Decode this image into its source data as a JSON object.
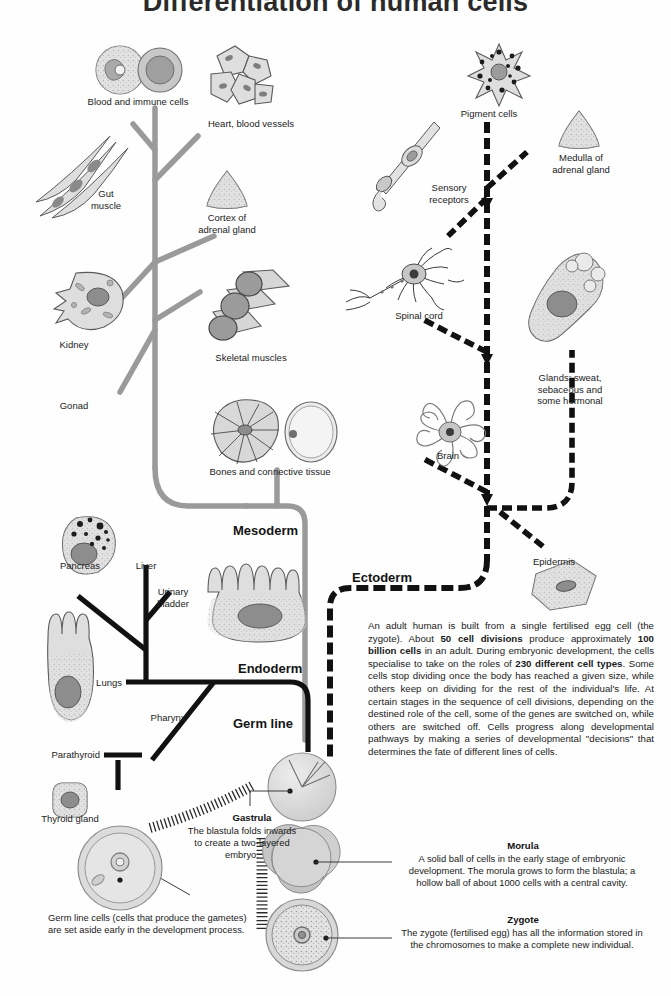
{
  "title": "Differentiation of human cells",
  "colors": {
    "mesoderm_line": "#9a9a9a",
    "endoderm_line": "#111111",
    "ectoderm_line": "#111111",
    "germline_line": "#333333",
    "cell_fill": "#dcdcdc",
    "cell_stroke": "#555555",
    "nucleus": "#8a8a8a",
    "text": "#1b1b1b"
  },
  "germ_layers": {
    "mesoderm": "Mesoderm",
    "endoderm": "Endoderm",
    "ectoderm": "Ectoderm",
    "germ_line": "Germ line"
  },
  "mesoderm_labels": [
    {
      "text": "Blood and immune cells"
    },
    {
      "text": "Heart, blood vessels"
    },
    {
      "text": "Gut\nmuscle"
    },
    {
      "text": "Cortex of\nadrenal gland"
    },
    {
      "text": "Kidney"
    },
    {
      "text": "Skeletal muscles"
    },
    {
      "text": "Gonad"
    },
    {
      "text": "Bones and connective tissue"
    }
  ],
  "endoderm_labels": [
    {
      "text": "Pancreas"
    },
    {
      "text": "Liver"
    },
    {
      "text": "Urinary\nbladder"
    },
    {
      "text": "Lungs"
    },
    {
      "text": "Pharynx"
    },
    {
      "text": "Parathyroid"
    },
    {
      "text": "Thyroid gland"
    }
  ],
  "ectoderm_labels": [
    {
      "text": "Pigment cells"
    },
    {
      "text": "Medulla of\nadrenal gland"
    },
    {
      "text": "Sensory\nreceptors"
    },
    {
      "text": "Spinal cord"
    },
    {
      "text": "Glands: sweat,\nsebaceous and\nsome hormonal"
    },
    {
      "text": "Brain"
    },
    {
      "text": "Epidermis"
    }
  ],
  "main_text": {
    "p1_a": "An adult human is built from a single fertilised egg cell (the zygote). About ",
    "p1_b1": "50 cell divisions",
    "p1_c": " produce approximately ",
    "p1_b2": "100 billion cells",
    "p1_d": " in an adult. During embryonic development, the cells specialise to take on the roles of ",
    "p1_b3": "230 different cell types",
    "p1_e": ". Some cells stop dividing once the body has reached a given size, while others keep on dividing for the rest of the individual's life.  At certain stages in the sequence of cell divisions, depending on the destined role of the cell, some of the genes are switched on, while others are switched off. Cells progress along developmental pathways by making a series of developmental \"decisions\" that determines the fate of different lines of cells."
  },
  "stages": {
    "gastrula": {
      "title": "Gastrula",
      "body": "The blastula folds\ninwards to create a\ntwo-layered embryo."
    },
    "morula": {
      "title": "Morula",
      "body": "A solid ball of cells in the early stage of embryonic development. The morula grows to form the blastula; a hollow ball of about 1000 cells with a central cavity."
    },
    "zygote": {
      "title": "Zygote",
      "body": "The zygote (fertilised egg) has all the information stored in the chromosomes to make a complete new individual."
    }
  },
  "germ_line_note": "Germ line cells (cells that produce\nthe gametes) are set aside early\nin the development process."
}
